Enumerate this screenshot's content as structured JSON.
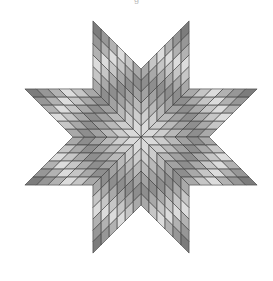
{
  "figure": {
    "caption_fragment": "g",
    "star": {
      "center": [
        141,
        137
      ],
      "points": 8,
      "grid": 6,
      "diamond_edge": 68,
      "stroke_color": "#3a3a3a",
      "band_colors": [
        "#dadada",
        "#cdcdcd",
        "#b9b9b9",
        "#a2a2a2",
        "#8e8e8e",
        "#a9a9a9",
        "#c6c6c6",
        "#dcdcdc",
        "#b2b2b2",
        "#979797",
        "#7c7c7c"
      ]
    }
  }
}
